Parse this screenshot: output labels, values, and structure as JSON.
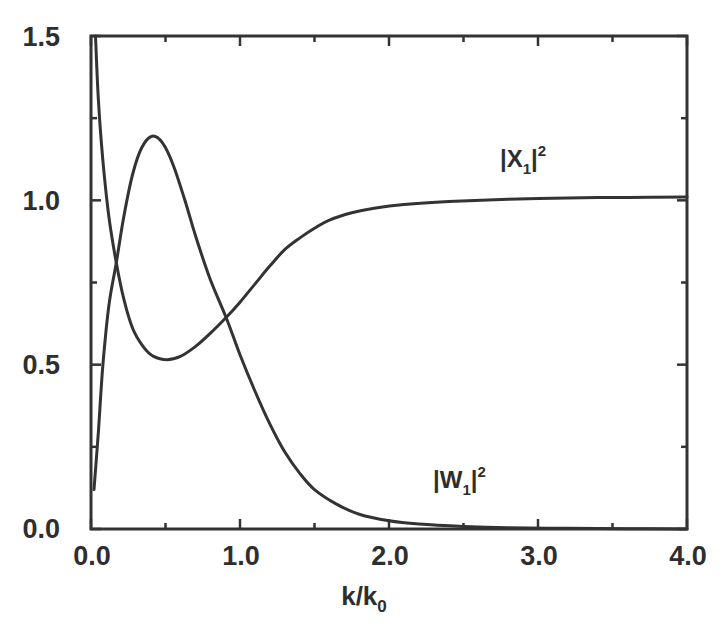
{
  "chart_data": {
    "type": "line",
    "title": "",
    "xlabel": "k/k0",
    "ylabel": "",
    "xlim": [
      0.0,
      4.0
    ],
    "ylim": [
      0.0,
      1.5
    ],
    "grid": false,
    "legend": "inline curve labels",
    "x_ticks": [
      "0.0",
      "1.0",
      "2.0",
      "3.0",
      "4.0"
    ],
    "y_ticks": [
      "0.0",
      "0.5",
      "1.0",
      "1.5"
    ],
    "series": [
      {
        "name": "|X1|^2",
        "label_main": "|X",
        "label_sub": "1",
        "label_close": "|",
        "label_sup": "2",
        "x": [
          0.03,
          0.05,
          0.08,
          0.12,
          0.17,
          0.22,
          0.28,
          0.35,
          0.42,
          0.51,
          0.6,
          0.7,
          0.8,
          0.91,
          1.0,
          1.1,
          1.2,
          1.3,
          1.4,
          1.5,
          1.6,
          1.75,
          1.9,
          2.1,
          2.4,
          2.8,
          3.2,
          3.6,
          4.0
        ],
        "values": [
          1.5,
          1.3,
          1.12,
          0.95,
          0.81,
          0.7,
          0.61,
          0.555,
          0.525,
          0.515,
          0.525,
          0.555,
          0.595,
          0.645,
          0.69,
          0.745,
          0.8,
          0.85,
          0.885,
          0.915,
          0.94,
          0.962,
          0.976,
          0.987,
          0.996,
          1.003,
          1.007,
          1.009,
          1.01
        ]
      },
      {
        "name": "|W1|^2",
        "label_main": "|W",
        "label_sub": "1",
        "label_close": "|",
        "label_sup": "2",
        "x": [
          0.02,
          0.05,
          0.08,
          0.12,
          0.17,
          0.22,
          0.28,
          0.34,
          0.41,
          0.48,
          0.55,
          0.63,
          0.71,
          0.8,
          0.91,
          1.0,
          1.1,
          1.2,
          1.3,
          1.4,
          1.5,
          1.65,
          1.8,
          2.0,
          2.2,
          2.5,
          2.8,
          3.2,
          3.6,
          4.0
        ],
        "values": [
          0.12,
          0.3,
          0.5,
          0.68,
          0.81,
          0.95,
          1.08,
          1.16,
          1.195,
          1.175,
          1.11,
          1.0,
          0.88,
          0.76,
          0.64,
          0.53,
          0.42,
          0.32,
          0.235,
          0.17,
          0.12,
          0.075,
          0.045,
          0.025,
          0.015,
          0.008,
          0.004,
          0.002,
          0.001,
          0.0
        ]
      }
    ]
  },
  "labels": {
    "x_title_main": "k/k",
    "x_title_sub": "0"
  }
}
